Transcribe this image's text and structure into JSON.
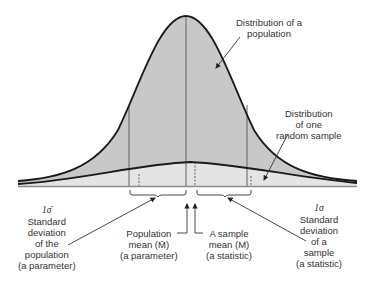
{
  "colors": {
    "population_fill": "#c8c8c8",
    "sample_fill": "#e4e4e4",
    "curve_stroke": "#1a1a1a",
    "baseline": "#8a8a8a",
    "text": "#333333"
  },
  "labels": {
    "population_distribution": [
      "Distribution of a",
      "population"
    ],
    "sample_distribution": [
      "Distribution",
      "of one",
      "random sample"
    ],
    "population_sd": {
      "symbol": "1σ̄",
      "lines": [
        "Standard",
        "deviation",
        "of the",
        "population",
        "(a parameter)"
      ]
    },
    "population_mean": {
      "lines": [
        "Population",
        "mean (M̄)",
        "(a parameter)"
      ]
    },
    "sample_mean": {
      "lines": [
        "A sample",
        "mean (M)",
        "(a statistic)"
      ]
    },
    "sample_sd": {
      "symbol": "1σ",
      "lines": [
        "Standard",
        "deviation",
        "of a",
        "sample",
        "(a statistic)"
      ]
    }
  },
  "diagram": {
    "baseline_y": 186,
    "x_range": [
      18,
      357
    ],
    "population_curve": {
      "mean_x": 186,
      "peak_y": 16,
      "sd_px": 58
    },
    "sample_curve": {
      "mean_x": 194,
      "peak_y": 162,
      "sd_px": 57
    },
    "population_sd_lines_x": [
      129,
      247
    ],
    "sample_dashed_lines_x": [
      139,
      194,
      251
    ]
  }
}
